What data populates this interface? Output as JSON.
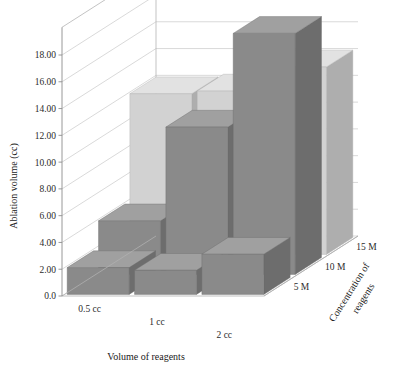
{
  "chart_data": {
    "type": "bar",
    "title": "",
    "subtitle": "",
    "xlabel": "Volume of reagents",
    "ylabel": "Ablation volume (cc)",
    "zlabel": "Concentration of reagents",
    "categories": [
      "0.5 cc",
      "1 cc",
      "2 cc"
    ],
    "depth_categories": [
      "5 M",
      "10 M",
      "15 M"
    ],
    "series": [
      {
        "name": "5 M",
        "values": [
          2.0,
          1.8,
          3.0
        ],
        "color": "#8a8a8a"
      },
      {
        "name": "10 M",
        "values": [
          4.0,
          11.0,
          18.0
        ],
        "color": "#8a8a8a"
      },
      {
        "name": "15 M",
        "values": [
          12.0,
          12.2,
          14.0
        ],
        "color": "#d2d2d2"
      }
    ],
    "ylim": [
      0,
      18
    ],
    "ytick_labels": [
      "0.0",
      "2.00",
      "4.00",
      "6.00",
      "8.00",
      "10.00",
      "12.00",
      "14.00",
      "16.00",
      "18.00"
    ],
    "ytick_values": [
      0,
      2,
      4,
      6,
      8,
      10,
      12,
      14,
      16,
      18
    ],
    "grid": true,
    "legend": "none",
    "projection": "3d"
  },
  "axes": {
    "y_title": "Ablation volume (cc)",
    "x_title": "Volume of reagents",
    "z_title_line1": "Concentration of",
    "z_title_line2": "reagents"
  },
  "colors": {
    "bar_dark_front": "#8a8a8a",
    "bar_dark_side": "#6d6d6d",
    "bar_dark_top": "#a0a0a0",
    "bar_light_front": "#d2d2d2",
    "bar_light_side": "#aeaeae",
    "bar_light_top": "#e2e2e2",
    "grid": "#c9c9c9",
    "axis": "#8d8d8d",
    "background": "#ffffff",
    "text": "#2b2b2b"
  }
}
